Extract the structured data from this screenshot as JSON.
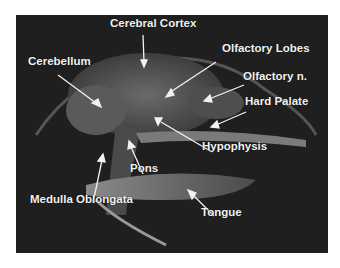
{
  "figure": {
    "type": "sagittal MRI of head",
    "background_color": "#1f1f1f",
    "label_color": "#f2f2f2",
    "labels": [
      {
        "text": "Cerebral Cortex",
        "x": 110,
        "y": 17
      },
      {
        "text": "Cerebellum",
        "x": 28,
        "y": 55
      },
      {
        "text": "Olfactory Lobes",
        "x": 222,
        "y": 42
      },
      {
        "text": "Olfactory n.",
        "x": 243,
        "y": 70
      },
      {
        "text": "Hard Palate",
        "x": 245,
        "y": 95
      },
      {
        "text": "Hypophysis",
        "x": 202,
        "y": 140
      },
      {
        "text": "Pons",
        "x": 130,
        "y": 162
      },
      {
        "text": "Medulla Oblongata",
        "x": 30,
        "y": 193
      },
      {
        "text": "Tongue",
        "x": 201,
        "y": 206
      }
    ]
  }
}
